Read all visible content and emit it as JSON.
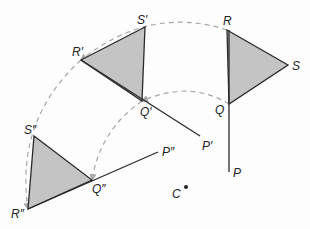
{
  "diagram": {
    "type": "rotation",
    "center": {
      "label": "C",
      "x": 186,
      "y": 187
    },
    "colors": {
      "fill": "#c4c4c4",
      "stroke": "#2a2a2a",
      "arc": "#a8a8a8"
    },
    "original": {
      "R": {
        "label": "R",
        "x": 227,
        "y": 30
      },
      "S": {
        "label": "S",
        "x": 288,
        "y": 65
      },
      "Q": {
        "label": "Q",
        "x": 229,
        "y": 104
      },
      "P": {
        "label": "P",
        "x": 229,
        "y": 172
      }
    },
    "image1": {
      "R": {
        "label": "R′",
        "x": 81,
        "y": 60
      },
      "S": {
        "label": "S′",
        "x": 145,
        "y": 27
      },
      "Q": {
        "label": "Q′",
        "x": 142,
        "y": 101
      },
      "P": {
        "label": "P′",
        "x": 200,
        "y": 136
      }
    },
    "image2": {
      "R": {
        "label": "R″",
        "x": 28,
        "y": 209
      },
      "S": {
        "label": "S″",
        "x": 34,
        "y": 136
      },
      "Q": {
        "label": "Q″",
        "x": 92,
        "y": 180
      },
      "P": {
        "label": "P″",
        "x": 158,
        "y": 152
      }
    }
  }
}
